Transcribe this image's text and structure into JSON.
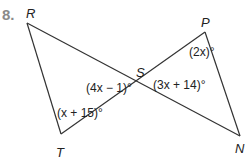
{
  "problem_number": "8.",
  "points": {
    "R": {
      "label": "R",
      "x": 27,
      "y": 23
    },
    "T": {
      "label": "T",
      "x": 61,
      "y": 144
    },
    "S": {
      "label": "S",
      "x": 139,
      "y": 83
    },
    "P": {
      "label": "P",
      "x": 205,
      "y": 32
    },
    "N": {
      "label": "N",
      "x": 240,
      "y": 136
    }
  },
  "angles": {
    "RST": "(4x − 1)°",
    "PSN": "(3x + 14)°",
    "P": "(2x)°",
    "T": "(x + 15)°"
  },
  "colors": {
    "line": "#333333",
    "number": "#8a8a8a"
  }
}
